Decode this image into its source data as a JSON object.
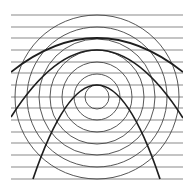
{
  "figure": {
    "type": "optical-illusion",
    "background": "#ffffff",
    "stroke_color": "#2a2a2a",
    "horizontal_lines": {
      "x_start": 11,
      "x_end": 183,
      "y_positions": [
        15,
        27,
        38,
        50,
        62,
        73,
        85,
        97,
        108,
        120,
        132,
        143,
        155,
        167,
        179
      ],
      "color": "#8a8a8a",
      "width": 1.2
    },
    "concentric_circles": {
      "center": [
        97,
        97
      ],
      "radii": [
        12,
        23,
        35,
        47,
        58,
        70,
        82
      ],
      "color": "#444444",
      "width": 0.9
    },
    "thick_arcs": [
      {
        "start": [
          11,
          72
        ],
        "apex": [
          97,
          38
        ],
        "end": [
          183,
          72
        ]
      },
      {
        "start": [
          11,
          117
        ],
        "apex": [
          97,
          50
        ],
        "end": [
          183,
          118
        ]
      },
      {
        "start": [
          33,
          179
        ],
        "apex": [
          97,
          85
        ],
        "end": [
          160,
          179
        ]
      }
    ],
    "thick_arc_color": "#1e1e1e",
    "thick_arc_width": 1.7,
    "clip": {
      "x": 11,
      "y": 14,
      "width": 172,
      "height": 166
    }
  }
}
